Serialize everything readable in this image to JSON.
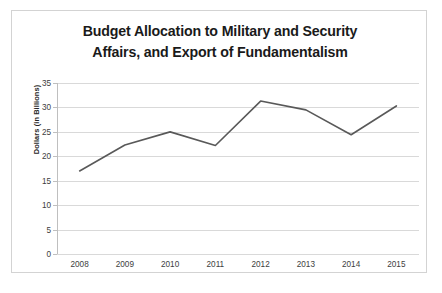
{
  "chart_data": {
    "type": "line",
    "title": "Budget Allocation to Military and Security Affairs, and Export of Fundamentalism",
    "title_line1": "Budget Allocation to Military and Security",
    "title_line2": "Affairs, and Export of Fundamentalism",
    "xlabel": "",
    "ylabel": "Dollars (in Billions)",
    "categories": [
      "2008",
      "2009",
      "2010",
      "2011",
      "2012",
      "2013",
      "2014",
      "2015"
    ],
    "values": [
      17,
      22.3,
      25,
      22.2,
      31.3,
      29.5,
      24.4,
      30.3
    ],
    "ylim": [
      0,
      35
    ],
    "ytick_labels": [
      "35",
      "30",
      "25",
      "20",
      "15",
      "10",
      "5",
      "0"
    ],
    "ytick_values": [
      35,
      30,
      25,
      20,
      15,
      10,
      5,
      0
    ],
    "ystep": 5,
    "grid": true,
    "legend": false,
    "series_color": "#595959",
    "grid_color": "#d9d9d9",
    "axis_color": "#bfbfbf",
    "border_color": "#d3d3d3",
    "background": "#ffffff"
  }
}
